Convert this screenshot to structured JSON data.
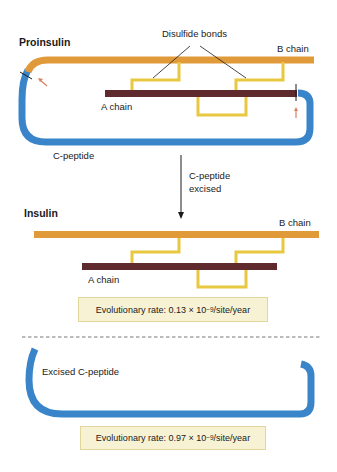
{
  "proinsulin": {
    "title": "Proinsulin",
    "disulfide_label": "Disulfide bonds",
    "b_chain_label": "B chain",
    "a_chain_label": "A chain",
    "c_peptide_label": "C-peptide"
  },
  "transition": {
    "line1": "C-peptide",
    "line2": "excised"
  },
  "insulin": {
    "title": "Insulin",
    "b_chain_label": "B chain",
    "a_chain_label": "A chain",
    "rate": {
      "prefix": "Evolutionary rate: 0.13 × 10",
      "exponent": "−9",
      "suffix": "/site/year"
    }
  },
  "excised": {
    "label": "Excised C-peptide",
    "rate": {
      "prefix": "Evolutionary rate: 0.97 × 10",
      "exponent": "−9",
      "suffix": "/site/year"
    }
  },
  "colors": {
    "b_chain": "#e09a3a",
    "a_chain": "#5e2a2e",
    "c_peptide": "#3a85c9",
    "disulfide": "#e8c840",
    "cut_mark": "#1a1a1a",
    "cleave_arrow": "#d98060",
    "box_fill": "#f7f2d4",
    "box_border": "#e2d79a"
  }
}
